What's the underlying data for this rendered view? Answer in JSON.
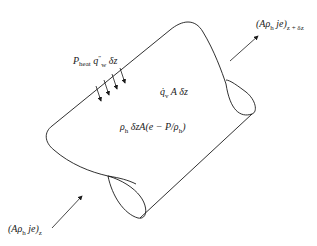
{
  "diagram": {
    "type": "control-volume-energy-balance",
    "labels": {
      "outflow": {
        "main": "(Aρ",
        "sub_h": "h",
        "rest": " je)",
        "subscript": "z + δz"
      },
      "inflow": {
        "main": "(Aρ",
        "sub_h": "h",
        "rest": " je)",
        "subscript": "z"
      },
      "heat_flux": {
        "P": "P",
        "sub_heat": "heat",
        "q": " q",
        "sup": "″",
        "sub_w": "w",
        "rest": " δz"
      },
      "volumetric_heat": {
        "q": "q̇",
        "sub_v": "v",
        "rest": " A δz"
      },
      "stored_energy": {
        "rho": "ρ",
        "sub_h": "h",
        "mid": " δzA(e − P/ρ",
        "sub_h2": "h",
        "end": ")"
      }
    },
    "arrows": {
      "heat_arrow_count": 4
    },
    "colors": {
      "stroke": "#1a1a1a",
      "background": "#ffffff"
    }
  }
}
